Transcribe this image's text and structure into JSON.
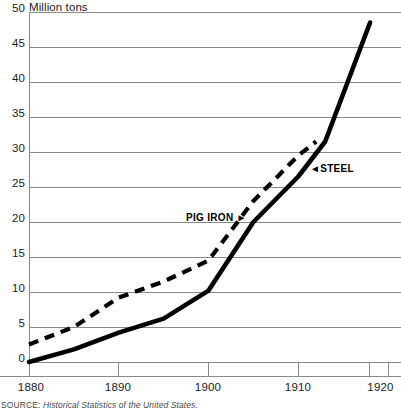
{
  "chart_data": {
    "type": "line",
    "title": "",
    "subtitle": "",
    "xlabel": "",
    "ylabel": "Million tons",
    "unit_label": "Million tons",
    "xlim": [
      1880,
      1920
    ],
    "ylim": [
      0,
      50
    ],
    "grid": true,
    "grid_axis": "y",
    "legend_position": "inline-annotations",
    "x_ticks": [
      1880,
      1890,
      1900,
      1910,
      1920
    ],
    "x_tick_labels": [
      "1880",
      "1890",
      "1900",
      "1910",
      "1920"
    ],
    "y_ticks": [
      0,
      5,
      10,
      15,
      20,
      25,
      30,
      35,
      40,
      45,
      50
    ],
    "y_tick_labels": [
      "0",
      "5",
      "10",
      "15",
      "20",
      "25",
      "30",
      "35",
      "40",
      "45",
      "50"
    ],
    "series": [
      {
        "name": "STEEL",
        "style": "solid",
        "color": "#000000",
        "x": [
          1880,
          1885,
          1890,
          1895,
          1900,
          1905,
          1910,
          1913,
          1918
        ],
        "values": [
          0,
          1.8,
          4.2,
          6.2,
          10.2,
          20.0,
          26.5,
          31.5,
          48.5
        ]
      },
      {
        "name": "PIG IRON",
        "style": "dashed",
        "color": "#000000",
        "x": [
          1880,
          1885,
          1890,
          1895,
          1900,
          1905,
          1910,
          1912
        ],
        "values": [
          2.5,
          5.0,
          9.2,
          11.5,
          14.5,
          23.0,
          29.5,
          31.5
        ]
      }
    ],
    "annotations": [
      {
        "text": "STEEL",
        "arrow": "left",
        "x": 1918,
        "y": 31.5
      },
      {
        "text": "PIG IRON",
        "arrow": "right",
        "x": 1899,
        "y": 21.5
      }
    ]
  },
  "source": {
    "key": "SOURCE:",
    "value": "Historical Statistics of the United States."
  },
  "annotations": {
    "steel_label": "STEEL",
    "steel_arrow": "◄",
    "pig_iron_label": "PIG IRON",
    "pig_iron_arrow": "►"
  }
}
